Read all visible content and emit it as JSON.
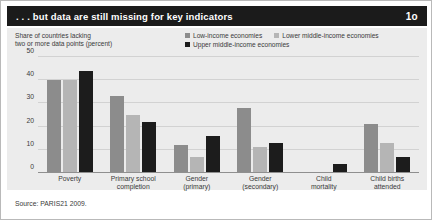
{
  "header": {
    "title": ". . . but data are still missing for key indicators",
    "figure_number": "1o"
  },
  "axis_title": "Share of countries lacking\ntwo or more data points (percent)",
  "source": "Source: PARIS21 2009.",
  "colors": {
    "low_income": "#8c8c8c",
    "lower_middle_income": "#b5b5b5",
    "upper_middle_income": "#1c1c1c",
    "panel_background": "#ececec",
    "title_bar": "#1b1b1b",
    "gridline": "#d2d2d2",
    "text": "#3a3a3a"
  },
  "chart_data": {
    "type": "bar",
    "title": ". . . but data are still missing for key indicators",
    "subtitle": "",
    "xlabel": "",
    "ylabel": "Share of countries lacking two or more data points (percent)",
    "ylim": [
      0,
      50
    ],
    "yticks": [
      0,
      10,
      20,
      30,
      40,
      50
    ],
    "ytick_labels": [
      "0",
      "10",
      "20",
      "30",
      "40",
      "50"
    ],
    "grid": true,
    "legend_position": "top-right",
    "categories": [
      "Poverty",
      "Primary school\ncompletion",
      "Gender\n(primary)",
      "Gender\n(secondary)",
      "Child\nmortality",
      "Child births\nattended"
    ],
    "series": [
      {
        "name": "Low-income economies",
        "color": "#8c8c8c",
        "values": [
          40,
          33,
          12,
          28,
          0,
          21
        ]
      },
      {
        "name": "Lower middle-income economies",
        "color": "#b5b5b5",
        "values": [
          40,
          25,
          7,
          11,
          0,
          13
        ]
      },
      {
        "name": "Upper middle-income economies",
        "color": "#1c1c1c",
        "values": [
          44,
          22,
          16,
          13,
          4,
          7
        ]
      }
    ]
  }
}
